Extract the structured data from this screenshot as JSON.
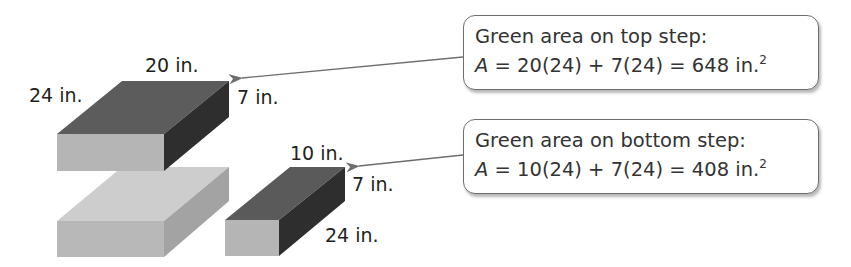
{
  "figure": {
    "colors": {
      "top_box_top": "#5c5c5c",
      "top_box_front": "#b5b5b5",
      "top_box_side": "#2e2e2e",
      "lower_box_top": "#cdcdcd",
      "lower_box_front": "#b8b8b8",
      "lower_box_side": "#a3a3a3",
      "small_box_top": "#5a5a5a",
      "small_box_front": "#b5b5b5",
      "small_box_side": "#2e2e2e",
      "arrow": "#6d6e71"
    },
    "labels": {
      "top_width": "20 in.",
      "top_depth": "24 in.",
      "top_height": "7 in.",
      "small_width": "10 in.",
      "small_height": "7 in.",
      "small_depth": "24 in."
    }
  },
  "callouts": [
    {
      "title": "Green area on top step:",
      "var": "A",
      "equation": " = 20(24) + 7(24) = 648 in.",
      "exponent": "2"
    },
    {
      "title": "Green area on bottom step:",
      "var": "A",
      "equation": " = 10(24) + 7(24) = 408 in.",
      "exponent": "2"
    }
  ]
}
